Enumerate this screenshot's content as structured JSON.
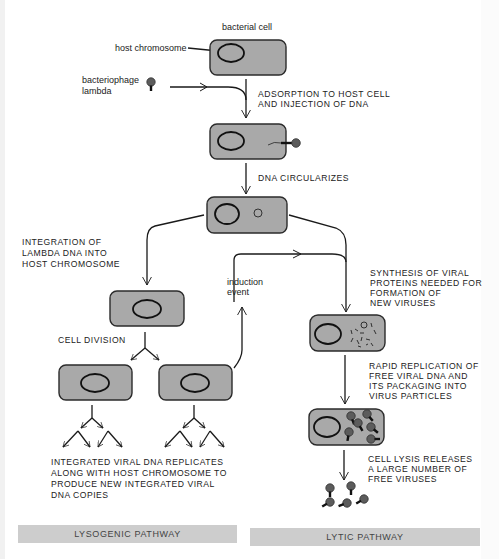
{
  "diagram": {
    "labels": {
      "bacterial_cell": "bacterial cell",
      "host_chromosome": "host chromosome",
      "bacteriophage_line1": "bacteriophage",
      "bacteriophage_line2": "lambda",
      "induction_line1": "induction",
      "induction_line2": "event"
    },
    "steps": {
      "adsorption": [
        "ADSORPTION TO HOST CELL",
        "AND INJECTION OF DNA"
      ],
      "circularizes": [
        "DNA CIRCULARIZES"
      ],
      "integration": [
        "INTEGRATION OF",
        "LAMBDA DNA INTO",
        "HOST CHROMOSOME"
      ],
      "cell_division": [
        "CELL DIVISION"
      ],
      "integrated_replicates": [
        "INTEGRATED VIRAL DNA REPLICATES",
        "ALONG WITH HOST CHROMOSOME TO",
        "PRODUCE NEW INTEGRATED VIRAL",
        "DNA COPIES"
      ],
      "synthesis": [
        "SYNTHESIS OF VIRAL",
        "PROTEINS NEEDED FOR",
        "FORMATION OF",
        "NEW VIRUSES"
      ],
      "rapid_replication": [
        "RAPID REPLICATION OF",
        "FREE VIRAL DNA AND",
        "ITS PACKAGING INTO",
        "VIRUS PARTICLES"
      ],
      "lysis": [
        "CELL LYSIS RELEASES",
        "A LARGE NUMBER OF",
        "FREE VIRUSES"
      ]
    },
    "pathways": {
      "lysogenic": "LYSOGENIC PATHWAY",
      "lytic": "LYTIC PATHWAY"
    },
    "colors": {
      "cell_fill": "#a9a9a9",
      "pathway_bar": "#cdcdcd",
      "line": "#1a1a1a"
    }
  }
}
